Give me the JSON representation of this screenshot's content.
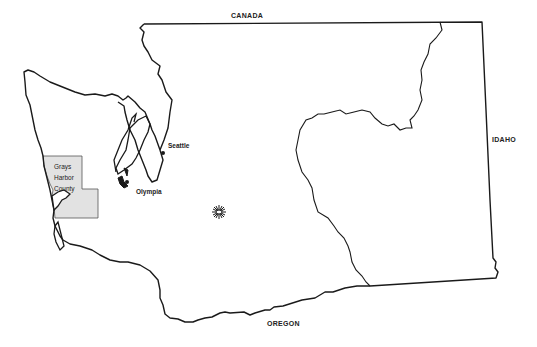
{
  "map": {
    "title": "Washington State",
    "borders": {
      "north": "CANADA",
      "east": "IDAHO",
      "south": "OREGON"
    },
    "cities": [
      {
        "name": "Seattle"
      },
      {
        "name": "Olympia"
      }
    ],
    "highlighted_county": {
      "line1": "Grays",
      "line2": "Harbor",
      "line3": "County",
      "fill": "#e2e2e2"
    },
    "colors": {
      "outline": "#1a1a1a",
      "county_fill": "#e2e2e2",
      "background": "#ffffff"
    }
  }
}
